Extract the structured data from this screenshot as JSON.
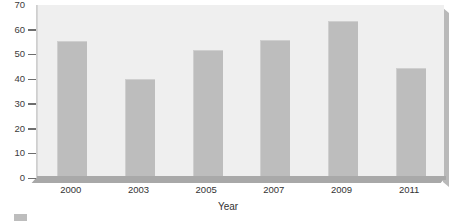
{
  "chart_data": {
    "type": "bar",
    "title": "",
    "xlabel": "Year",
    "ylabel": "",
    "categories": [
      "2000",
      "2003",
      "2005",
      "2007",
      "2009",
      "2011"
    ],
    "values": [
      55,
      39.5,
      51.5,
      55.5,
      63,
      44
    ],
    "series": [
      {
        "name": "",
        "values": [
          55,
          39.5,
          51.5,
          55.5,
          63,
          44
        ]
      }
    ],
    "ylim": [
      0,
      70
    ],
    "yticks": [
      0,
      10,
      20,
      30,
      40,
      50,
      60,
      70
    ],
    "ytick_labels": [
      "0",
      "10",
      "20",
      "30",
      "40",
      "50",
      "60",
      "70"
    ],
    "xtick_labels": [
      "2000",
      "2003",
      "2005",
      "2007",
      "2009",
      "2011"
    ],
    "grid": false,
    "legend_position": "bottom-left",
    "legend_entries": [
      {
        "label": "",
        "color": "#bdbdbd"
      }
    ],
    "colors": {
      "bar": "#bdbdbd",
      "plot_background": "#efefef",
      "page_background": "#ffffff",
      "axis": "#a9a9a9",
      "text": "#333333"
    }
  }
}
